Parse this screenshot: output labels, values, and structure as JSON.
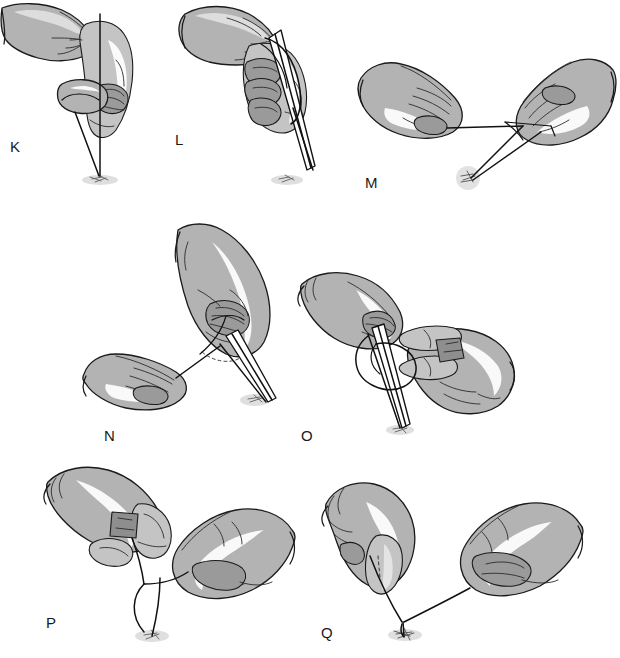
{
  "figure": {
    "background_color": "#ffffff",
    "width": 620,
    "height": 658,
    "style": {
      "glove_fill": "#b3b3b3",
      "glove_light": "#c4c4c4",
      "glove_dark": "#9a9a9a",
      "outline_color": "#1a1a1a",
      "thread_color": "#111111",
      "shadow_color": "#c9c9c9",
      "label_color": "#1a1a1a"
    }
  },
  "panels": [
    {
      "id": "K",
      "label": "K",
      "label_x": 10,
      "label_y": 147,
      "caption": "Gloved hands hold suture thread vertically over the tissue site with needle holder directed downward",
      "elements": {
        "hands": 2,
        "instruments": [
          "needle-holder"
        ],
        "thread": "vertical-strand-with-loop",
        "tissue_site": "puncture-site-shadow"
      }
    },
    {
      "id": "L",
      "label": "L",
      "label_x": 175,
      "label_y": 140,
      "caption": "Thread wrapped around the needle holder tip while the opposite hand tensions the strand",
      "elements": {
        "hands": 2,
        "instruments": [
          "needle-holder"
        ],
        "thread": "wrapped-around-instrument",
        "tissue_site": "puncture-site-shadow"
      }
    },
    {
      "id": "M",
      "label": "M",
      "label_x": 365,
      "label_y": 183,
      "caption": "Both hands pull the thread ends laterally to lay the first throw flat against the tissue",
      "elements": {
        "hands": 2,
        "instruments": [
          "needle-holder"
        ],
        "thread": "horizontal-tensioned-strands",
        "tissue_site": "puncture-site-shadow"
      }
    },
    {
      "id": "N",
      "label": "N",
      "label_x": 104,
      "label_y": 428,
      "caption": "Right hand grasps a needle holder angled toward the wound while the left hand holds the free end of the suture",
      "elements": {
        "hands": 2,
        "instruments": [
          "needle-holder"
        ],
        "thread": "angled-strand-across-instrument",
        "tissue_site": "puncture-site-shadow"
      }
    },
    {
      "id": "O",
      "label": "O",
      "label_x": 301,
      "label_y": 428,
      "caption": "Suture loop is thrown over the instrument jaws for the second half-hitch of the knot",
      "elements": {
        "hands": 2,
        "instruments": [
          "needle-holder"
        ],
        "thread": "loop-over-instrument",
        "tissue_site": "puncture-site-shadow"
      }
    },
    {
      "id": "P",
      "label": "P",
      "label_x": 46,
      "label_y": 621,
      "caption": "Left hand holds the needle between thumb and index finger while the right hand draws the thread loop downward",
      "elements": {
        "hands": 2,
        "instruments": [
          "needle"
        ],
        "thread": "descending-loop",
        "tissue_site": "puncture-site-shadow"
      }
    },
    {
      "id": "Q",
      "label": "Q",
      "label_x": 321,
      "label_y": 636,
      "caption": "Final snug of the completed knot directly down onto the tissue surface",
      "elements": {
        "hands": 2,
        "instruments": [
          "needle"
        ],
        "thread": "tightened-knot-at-tissue",
        "tissue_site": "puncture-site-shadow"
      }
    }
  ]
}
